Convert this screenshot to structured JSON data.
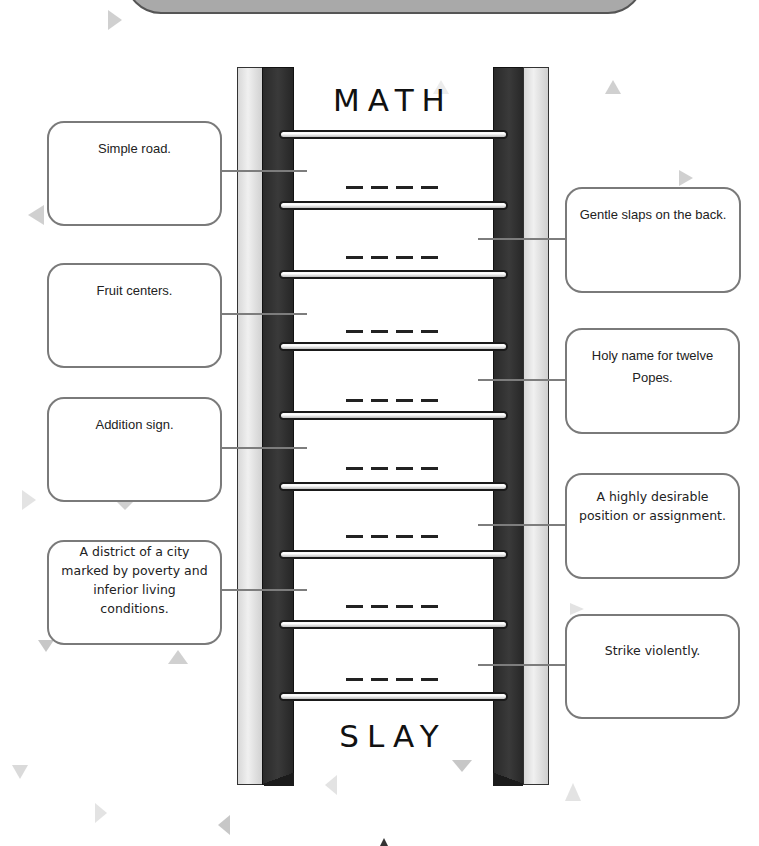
{
  "worksheet": {
    "start_word": "MATH",
    "end_word": "SLAY",
    "blank_placeholder": "_ _ _ _",
    "letters_per_blank": 4,
    "rung_count": 9,
    "blank_count": 8
  },
  "clues": {
    "left": [
      {
        "text": "Simple road."
      },
      {
        "text": "Fruit centers."
      },
      {
        "text": "Addition sign."
      },
      {
        "text": "A district of a city marked by poverty and inferior living conditions."
      }
    ],
    "right": [
      {
        "text": "Gentle slaps on the back."
      },
      {
        "text": "Holy name for twelve Popes."
      },
      {
        "text": "A highly desirable position or assignment."
      },
      {
        "text": "Strike violently."
      }
    ]
  },
  "colors": {
    "rail_dark": "#2e2e2e",
    "rail_light": "#e6e6e6",
    "box_border": "#7a7a7a",
    "connector": "#7d7d7d",
    "confetti": "#b5b5b5"
  }
}
